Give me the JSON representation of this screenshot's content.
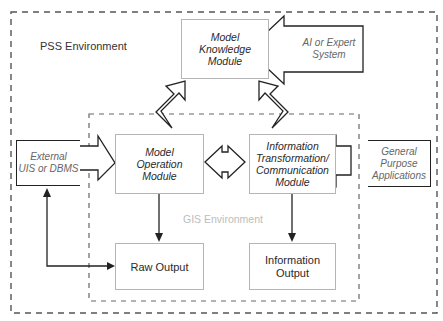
{
  "diagram": {
    "environments": {
      "pss": {
        "label": "PSS Environment"
      },
      "gis": {
        "label": "GIS Environment"
      }
    },
    "modules": {
      "knowledge": {
        "line1": "Model",
        "line2": "Knowledge",
        "line3": "Module"
      },
      "operation": {
        "line1": "Model",
        "line2": "Operation",
        "line3": "Module"
      },
      "transformation": {
        "line1": "Information",
        "line2": "Transformation/",
        "line3": "Communication",
        "line4": "Module"
      }
    },
    "external_sources": {
      "ai": {
        "line1": "AI or Expert",
        "line2": "System"
      },
      "uis": {
        "line1": "External",
        "line2": "UIS or DBMS"
      },
      "general": {
        "line1": "General",
        "line2": "Purpose",
        "line3": "Applications"
      }
    },
    "outputs": {
      "raw": {
        "label": "Raw Output"
      },
      "info": {
        "line1": "Information",
        "line2": "Output"
      }
    },
    "colors": {
      "module_border": "#b5b5b5",
      "external_border": "#222222",
      "dashed_border": "#555555",
      "gis_label": "#bdbdbd"
    }
  }
}
